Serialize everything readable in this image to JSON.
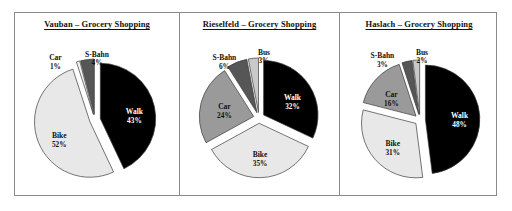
{
  "figure": {
    "border_color": "#8a8a8a",
    "background": "#ffffff"
  },
  "palette": {
    "walk": "#000000",
    "bike": "#e8e8e8",
    "car": "#9a9a9a",
    "sbahn": "#565656",
    "bus": "#c9c9c9",
    "car_vauban": "#f2f2f2",
    "outline": "#3a3a3a"
  },
  "panels": [
    {
      "id": "vauban",
      "title": "Vauban – Grocery Shopping",
      "labels": {
        "walk": "Walk",
        "bike": "Bike",
        "car": "Car",
        "sbahn": "S-Bahn",
        "bus": "Bus"
      },
      "values_text": {
        "walk": "43%",
        "bike": "52%",
        "car": "1%",
        "sbahn": "4%"
      }
    },
    {
      "id": "rieselfeld",
      "title": "Rieselfeld – Grocery Shopping",
      "labels": {
        "walk": "Walk",
        "bike": "Bike",
        "car": "Car",
        "sbahn": "S-Bahn",
        "bus": "Bus"
      },
      "values_text": {
        "walk": "32%",
        "bike": "35%",
        "car": "24%",
        "sbahn": "6%",
        "bus": "3%"
      }
    },
    {
      "id": "haslach",
      "title": "Haslach – Grocery Shopping",
      "labels": {
        "walk": "Walk",
        "bike": "Bike",
        "car": "Car",
        "sbahn": "S-Bahn",
        "bus": "Bus"
      },
      "values_text": {
        "walk": "48%",
        "bike": "31%",
        "car": "16%",
        "sbahn": "3%",
        "bus": "2%"
      }
    }
  ],
  "chart_data": [
    {
      "type": "pie",
      "title": "Vauban – Grocery Shopping",
      "categories": [
        "Walk",
        "Bike",
        "Car",
        "S-Bahn"
      ],
      "values": [
        43,
        52,
        1,
        4
      ],
      "unit": "percent",
      "exploded": true,
      "start_angle_deg": 0,
      "direction": "clockwise",
      "colors": [
        "#000000",
        "#e8e8e8",
        "#f2f2f2",
        "#565656"
      ],
      "labels_inside": [
        "Walk",
        "Bike"
      ],
      "labels_outside": [
        "Car",
        "S-Bahn"
      ],
      "legend": "none"
    },
    {
      "type": "pie",
      "title": "Rieselfeld – Grocery Shopping",
      "categories": [
        "Walk",
        "Bike",
        "Car",
        "S-Bahn",
        "Bus"
      ],
      "values": [
        32,
        35,
        24,
        6,
        3
      ],
      "unit": "percent",
      "exploded": true,
      "start_angle_deg": 0,
      "direction": "clockwise",
      "colors": [
        "#000000",
        "#e8e8e8",
        "#9a9a9a",
        "#565656",
        "#c9c9c9"
      ],
      "labels_inside": [
        "Walk",
        "Bike",
        "Car"
      ],
      "labels_outside": [
        "S-Bahn",
        "Bus"
      ],
      "legend": "none"
    },
    {
      "type": "pie",
      "title": "Haslach – Grocery Shopping",
      "categories": [
        "Walk",
        "Bike",
        "Car",
        "S-Bahn",
        "Bus"
      ],
      "values": [
        48,
        31,
        16,
        3,
        2
      ],
      "unit": "percent",
      "exploded": true,
      "start_angle_deg": 0,
      "direction": "clockwise",
      "colors": [
        "#000000",
        "#e8e8e8",
        "#9a9a9a",
        "#565656",
        "#c9c9c9"
      ],
      "labels_inside": [
        "Walk",
        "Bike",
        "Car"
      ],
      "labels_outside": [
        "S-Bahn",
        "Bus"
      ],
      "legend": "none"
    }
  ]
}
